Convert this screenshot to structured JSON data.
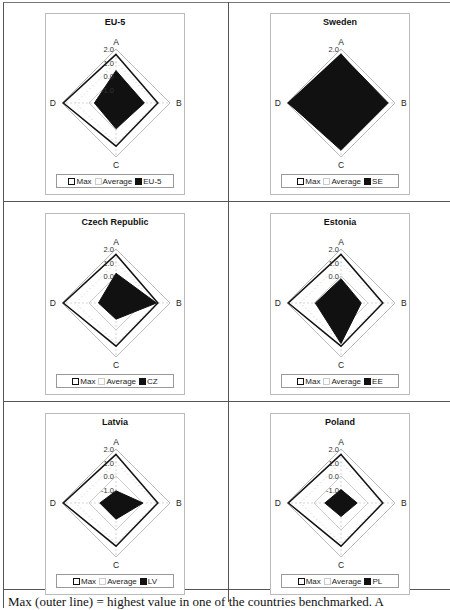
{
  "chart_data": [
    {
      "type": "radar",
      "title": "EU-5",
      "categories": [
        "A",
        "B",
        "C",
        "D"
      ],
      "ticks": [
        "2.0",
        "1.0",
        "0.0",
        "-1.0"
      ],
      "rlim": [
        -2,
        2
      ],
      "legend": [
        "Max",
        "Average",
        "EU-5"
      ],
      "series": [
        {
          "name": "Max",
          "values": [
            1.6,
            1.1,
            1.2,
            1.9
          ]
        },
        {
          "name": "Average",
          "values": [
            0.0,
            0.0,
            0.0,
            0.0
          ]
        },
        {
          "name": "EU-5",
          "values": [
            0.4,
            0.1,
            -0.1,
            -0.4
          ]
        }
      ]
    },
    {
      "type": "radar",
      "title": "Sweden",
      "categories": [
        "A",
        "B",
        "C",
        "D"
      ],
      "ticks": [
        "2.0"
      ],
      "rlim": [
        -2,
        2
      ],
      "legend": [
        "Max",
        "Average",
        "SE"
      ],
      "series": [
        {
          "name": "Max",
          "values": [
            1.6,
            1.1,
            1.2,
            1.9
          ]
        },
        {
          "name": "Average",
          "values": [
            0.0,
            0.0,
            0.0,
            0.0
          ]
        },
        {
          "name": "SE",
          "values": [
            1.6,
            1.5,
            1.5,
            1.9
          ]
        }
      ]
    },
    {
      "type": "radar",
      "title": "Czech Republic",
      "categories": [
        "A",
        "B",
        "C",
        "D"
      ],
      "ticks": [
        "2.0",
        "1.0",
        "0.0"
      ],
      "rlim": [
        -2,
        2
      ],
      "legend": [
        "Max",
        "Average",
        "CZ"
      ],
      "series": [
        {
          "name": "Max",
          "values": [
            1.6,
            1.1,
            1.2,
            1.9
          ]
        },
        {
          "name": "Average",
          "values": [
            0.0,
            0.0,
            0.0,
            0.0
          ]
        },
        {
          "name": "CZ",
          "values": [
            0.2,
            1.0,
            -0.8,
            -0.7
          ]
        }
      ]
    },
    {
      "type": "radar",
      "title": "Estonia",
      "categories": [
        "A",
        "B",
        "C",
        "D"
      ],
      "ticks": [
        "2.0",
        "1.0",
        "0.0"
      ],
      "rlim": [
        -2,
        2
      ],
      "legend": [
        "Max",
        "Average",
        "EE"
      ],
      "series": [
        {
          "name": "Max",
          "values": [
            1.6,
            1.1,
            1.2,
            1.9
          ]
        },
        {
          "name": "Average",
          "values": [
            0.0,
            0.0,
            0.0,
            0.0
          ]
        },
        {
          "name": "EE",
          "values": [
            -0.2,
            -0.5,
            1.0,
            -0.1
          ]
        }
      ]
    },
    {
      "type": "radar",
      "title": "Latvia",
      "categories": [
        "A",
        "B",
        "C",
        "D"
      ],
      "ticks": [
        "2.0",
        "1.0",
        "0.0",
        "-1.0"
      ],
      "rlim": [
        -2,
        2
      ],
      "legend": [
        "Max",
        "Average",
        "LV"
      ],
      "series": [
        {
          "name": "Max",
          "values": [
            1.6,
            1.1,
            1.2,
            1.9
          ]
        },
        {
          "name": "Average",
          "values": [
            0.0,
            0.0,
            0.0,
            0.0
          ]
        },
        {
          "name": "LV",
          "values": [
            -1.1,
            0.0,
            -0.8,
            -0.8
          ]
        }
      ]
    },
    {
      "type": "radar",
      "title": "Poland",
      "categories": [
        "A",
        "B",
        "C",
        "D"
      ],
      "ticks": [
        "2.0",
        "1.0",
        "0.0",
        "-1.0"
      ],
      "rlim": [
        -2,
        2
      ],
      "legend": [
        "Max",
        "Average",
        "PL"
      ],
      "series": [
        {
          "name": "Max",
          "values": [
            1.6,
            1.1,
            1.2,
            1.9
          ]
        },
        {
          "name": "Average",
          "values": [
            0.0,
            0.0,
            0.0,
            0.0
          ]
        },
        {
          "name": "PL",
          "values": [
            -1.0,
            -0.8,
            -1.0,
            -0.8
          ]
        }
      ]
    }
  ],
  "caption": "Max (outer line) = highest value in one of the countries benchmarked. A"
}
